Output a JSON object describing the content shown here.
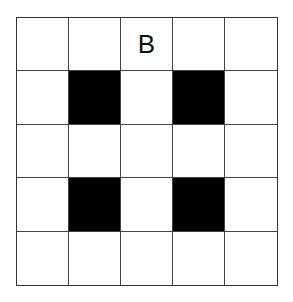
{
  "grid": {
    "rows": 5,
    "cols": 5,
    "cells": [
      [
        "",
        "",
        "B",
        "",
        ""
      ],
      [
        "",
        "#",
        "",
        "#",
        ""
      ],
      [
        "",
        "",
        "",
        "",
        ""
      ],
      [
        "",
        "#",
        "",
        "#",
        ""
      ],
      [
        "",
        "",
        "",
        "",
        ""
      ]
    ],
    "filled_color": "#000000",
    "empty_color": "#ffffff",
    "label": "B"
  }
}
